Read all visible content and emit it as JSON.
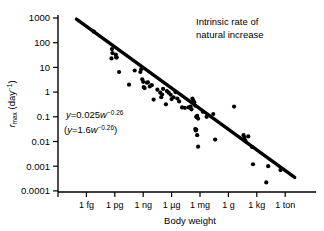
{
  "chart_data": {
    "type": "scatter",
    "title": "",
    "annotation_title": "Intrinsic rate of\nnatural increase",
    "annotation_line1": "Intrinsic rate of",
    "annotation_line2": "natural increase",
    "xlabel": "Body weight",
    "ylabel_main": "r",
    "ylabel_sub": "max",
    "ylabel_unit": "(day",
    "ylabel_unit_sup": "−1",
    "ylabel_unit_close": ")",
    "xscale": "log",
    "yscale": "log",
    "grid": false,
    "legend": "none",
    "ylim": [
      0.0001,
      1000
    ],
    "yticks": [
      1000,
      100,
      10,
      1,
      0.1,
      0.01,
      0.001,
      0.0001
    ],
    "ytick_labels": [
      "1000",
      "100",
      "10",
      "1",
      "0.1",
      "0.01",
      "0.001",
      "0.0001"
    ],
    "xticks_log10_grams": [
      -15,
      -12,
      -9,
      -6,
      -3,
      0,
      3,
      6
    ],
    "xtick_labels": [
      "1 fg",
      "1 pg",
      "1 ng",
      "1 µg",
      "1 mg",
      "1 g",
      "1 kg",
      "1 ton"
    ],
    "fit_equation_1": {
      "lhs": "y",
      "eq": "=",
      "coefficient": "0.025",
      "variable": "w",
      "exponent": "−0.26",
      "text": "y = 0.025w^−0.26"
    },
    "fit_equation_2": {
      "open": "(",
      "lhs": "y",
      "eq": "=",
      "coefficient": "1.6",
      "variable": "w",
      "exponent": "−0.26",
      "close": ")",
      "text": "(y = 1.6w^−0.26)"
    },
    "regression_line": {
      "x_start_log10g": -16.05,
      "y_start": 900,
      "x_end_log10g": 7.0,
      "y_end": 0.00035
    },
    "points": [
      {
        "xw": -14.2,
        "y": 280
      },
      {
        "xw": -12.3,
        "y": 55
      },
      {
        "xw": -12.25,
        "y": 38
      },
      {
        "xw": -12.35,
        "y": 23
      },
      {
        "xw": -11.9,
        "y": 33
      },
      {
        "xw": -11.85,
        "y": 26
      },
      {
        "xw": -11.8,
        "y": 25
      },
      {
        "xw": -11.55,
        "y": 6.5
      },
      {
        "xw": -10.5,
        "y": 2.0
      },
      {
        "xw": -9.9,
        "y": 7.5
      },
      {
        "xw": -9.3,
        "y": 6.5
      },
      {
        "xw": -9.2,
        "y": 8.5
      },
      {
        "xw": -9.1,
        "y": 3.3
      },
      {
        "xw": -9.0,
        "y": 2.6
      },
      {
        "xw": -8.95,
        "y": 1.6
      },
      {
        "xw": -8.85,
        "y": 1.45
      },
      {
        "xw": -8.6,
        "y": 2.4
      },
      {
        "xw": -8.5,
        "y": 2.5
      },
      {
        "xw": -8.3,
        "y": 1.7
      },
      {
        "xw": -8.1,
        "y": 1.9
      },
      {
        "xw": -7.9,
        "y": 0.5
      },
      {
        "xw": -7.5,
        "y": 1.25
      },
      {
        "xw": -7.2,
        "y": 0.95
      },
      {
        "xw": -7.1,
        "y": 0.62
      },
      {
        "xw": -7.0,
        "y": 0.8
      },
      {
        "xw": -6.9,
        "y": 1.35
      },
      {
        "xw": -6.6,
        "y": 0.32
      },
      {
        "xw": -6.5,
        "y": 1.1
      },
      {
        "xw": -6.3,
        "y": 0.95
      },
      {
        "xw": -6.1,
        "y": 0.78
      },
      {
        "xw": -6.0,
        "y": 0.52
      },
      {
        "xw": -5.8,
        "y": 0.62
      },
      {
        "xw": -5.6,
        "y": 1.0
      },
      {
        "xw": -5.4,
        "y": 0.55
      },
      {
        "xw": -5.2,
        "y": 0.42
      },
      {
        "xw": -4.9,
        "y": 0.24
      },
      {
        "xw": -4.6,
        "y": 0.23
      },
      {
        "xw": -4.2,
        "y": 0.24
      },
      {
        "xw": -4.0,
        "y": 0.26
      },
      {
        "xw": -3.9,
        "y": 0.2
      },
      {
        "xw": -3.8,
        "y": 0.55
      },
      {
        "xw": -3.7,
        "y": 0.45
      },
      {
        "xw": -3.6,
        "y": 0.38
      },
      {
        "xw": -3.5,
        "y": 0.28
      },
      {
        "xw": -3.4,
        "y": 0.1
      },
      {
        "xw": -3.35,
        "y": 0.098
      },
      {
        "xw": -3.3,
        "y": 0.11
      },
      {
        "xw": -3.2,
        "y": 0.085
      },
      {
        "xw": -3.5,
        "y": 0.032
      },
      {
        "xw": -3.45,
        "y": 0.028
      },
      {
        "xw": -3.4,
        "y": 0.03
      },
      {
        "xw": -3.3,
        "y": 0.018
      },
      {
        "xw": -3.2,
        "y": 0.0062
      },
      {
        "xw": -2.7,
        "y": 0.16
      },
      {
        "xw": -2.3,
        "y": 0.1
      },
      {
        "xw": -1.6,
        "y": 0.13
      },
      {
        "xw": -1.4,
        "y": 0.012
      },
      {
        "xw": 0.6,
        "y": 0.26
      },
      {
        "xw": 1.6,
        "y": 0.018
      },
      {
        "xw": 1.7,
        "y": 0.014
      },
      {
        "xw": 1.75,
        "y": 0.011
      },
      {
        "xw": 1.8,
        "y": 0.0105
      },
      {
        "xw": 2.1,
        "y": 0.016
      },
      {
        "xw": 2.5,
        "y": 0.006
      },
      {
        "xw": 2.6,
        "y": 0.0012
      },
      {
        "xw": 4.2,
        "y": 0.001
      },
      {
        "xw": 4.0,
        "y": 0.00022
      },
      {
        "xw": 5.5,
        "y": 0.0007
      }
    ]
  }
}
